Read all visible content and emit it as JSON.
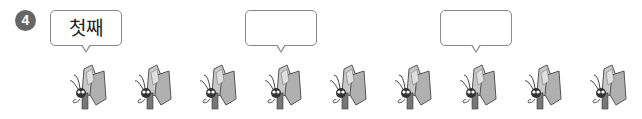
{
  "problem_number": "4",
  "bubbles": [
    {
      "text": "첫째",
      "x": 50
    },
    {
      "text": "",
      "x": 245
    },
    {
      "text": "",
      "x": 440
    }
  ],
  "butterflies": {
    "count": 9,
    "x_positions": [
      68,
      133,
      198,
      263,
      328,
      393,
      458,
      523,
      588
    ],
    "icon": "butterfly-icon"
  },
  "colors": {
    "number_badge": "#666666",
    "bubble_border": "#888888",
    "wing_light": "#d0d0d0",
    "wing_dark": "#a0a0a0"
  }
}
